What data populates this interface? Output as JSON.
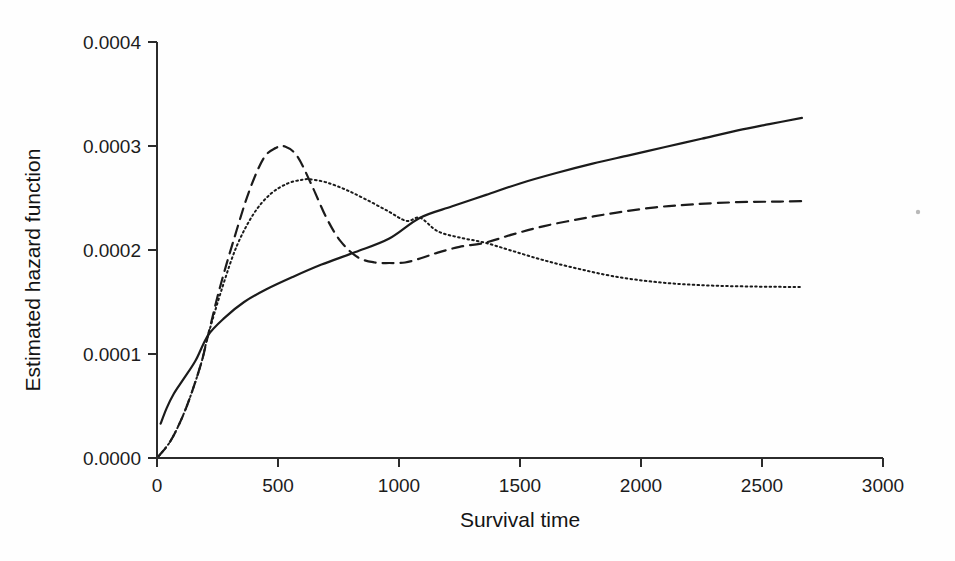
{
  "chart_data": {
    "type": "line",
    "title": "",
    "xlabel": "Survival time",
    "ylabel": "Estimated hazard function",
    "xlim": [
      0,
      3000
    ],
    "ylim": [
      0.0,
      0.0004
    ],
    "xticks": [
      0,
      500,
      1000,
      1500,
      2000,
      2500,
      3000
    ],
    "xtick_labels": [
      "0",
      "500",
      "1000",
      "1500",
      "2000",
      "2500",
      "3000"
    ],
    "yticks": [
      0.0,
      0.0001,
      0.0002,
      0.0003,
      0.0004
    ],
    "ytick_labels": [
      "0.0000",
      "0.0001",
      "0.0002",
      "0.0003",
      "0.0004"
    ],
    "grid": false,
    "legend": "none",
    "series": [
      {
        "name": "solid-hazard-estimate",
        "style": "solid",
        "color": "#1b1b1b",
        "x": [
          15,
          40,
          70,
          110,
          160,
          211,
          280,
          360,
          450,
          560,
          680,
          820,
          960,
          1087,
          1220,
          1360,
          1500,
          1650,
          1800,
          1950,
          2100,
          2250,
          2400,
          2530,
          2665
        ],
        "y": [
          3.3e-05,
          4.8e-05,
          6.2e-05,
          7.6e-05,
          9.4e-05,
          0.000118,
          0.000135,
          0.00015,
          0.000162,
          0.000174,
          0.000186,
          0.000198,
          0.000211,
          0.000231,
          0.000242,
          0.000253,
          0.000264,
          0.000274,
          0.000283,
          0.000291,
          0.000299,
          0.000307,
          0.000315,
          0.000321,
          0.000327
        ]
      },
      {
        "name": "dashed-hazard-estimate",
        "style": "dashed",
        "color": "#1b1b1b",
        "x": [
          8,
          60,
          120,
          180,
          211,
          260,
          320,
          380,
          440,
          490,
          529,
          580,
          640,
          700,
          760,
          830,
          900,
          960,
          1025,
          1090,
          1160,
          1250,
          1355,
          1470,
          1600,
          1750,
          1900,
          2060,
          2220,
          2400,
          2550,
          2665
        ],
        "y": [
          2e-06,
          1.8e-05,
          4.8e-05,
          8.9e-05,
          0.000118,
          0.000164,
          0.000212,
          0.000256,
          0.000288,
          0.000298,
          0.0002995,
          0.00029,
          0.000262,
          0.000231,
          0.000208,
          0.000193,
          0.000188,
          0.0001875,
          0.000188,
          0.000192,
          0.0001975,
          0.000203,
          0.000207,
          0.000215,
          0.000223,
          0.00023,
          0.000236,
          0.000241,
          0.000244,
          0.000246,
          0.0002465,
          0.000247
        ]
      },
      {
        "name": "dotted-hazard-estimate",
        "style": "dotted",
        "color": "#2b2b2b",
        "x": [
          8,
          60,
          120,
          180,
          211,
          270,
          330,
          400,
          470,
          540,
          600,
          632,
          700,
          780,
          860,
          950,
          1030,
          1087,
          1160,
          1250,
          1355,
          1470,
          1600,
          1740,
          1880,
          2030,
          2180,
          2330,
          2480,
          2600,
          2665
        ],
        "y": [
          2e-06,
          1.8e-05,
          4.8e-05,
          8.9e-05,
          0.000118,
          0.000164,
          0.000204,
          0.000235,
          0.000254,
          0.000264,
          0.0002675,
          0.000268,
          0.000265,
          0.000258,
          0.000249,
          0.000238,
          0.000228,
          0.000231,
          0.000218,
          0.000212,
          0.000207,
          0.000199,
          0.00019,
          0.000182,
          0.000175,
          0.00017,
          0.000167,
          0.0001655,
          0.0001648,
          0.0001645,
          0.0001644
        ]
      }
    ]
  },
  "figure": {
    "background_color": "#fefefe",
    "ink_color": "#1b1b1b"
  }
}
